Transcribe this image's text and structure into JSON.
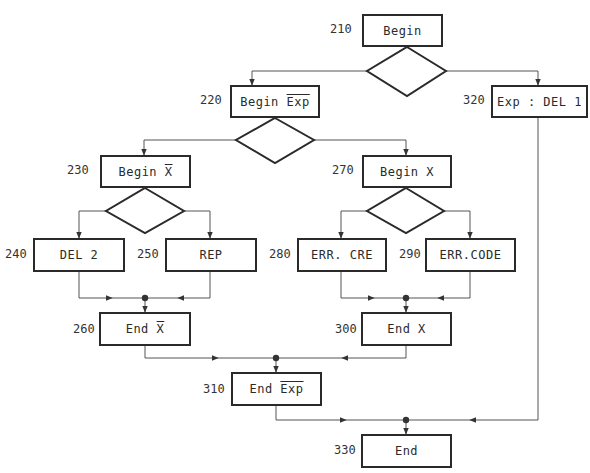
{
  "diagram": {
    "type": "flowchart",
    "nodes": [
      {
        "id": "210",
        "number": "210",
        "text": "Begin",
        "overline": ""
      },
      {
        "id": "220",
        "number": "220",
        "text": "Begin ",
        "overline": "Exp"
      },
      {
        "id": "320",
        "number": "320",
        "text": "Exp : DEL 1",
        "overline": ""
      },
      {
        "id": "230",
        "number": "230",
        "text": "Begin ",
        "overline": "X"
      },
      {
        "id": "270",
        "number": "270",
        "text": "Begin X",
        "overline": ""
      },
      {
        "id": "240",
        "number": "240",
        "text": "DEL 2",
        "overline": ""
      },
      {
        "id": "250",
        "number": "250",
        "text": "REP",
        "overline": ""
      },
      {
        "id": "280",
        "number": "280",
        "text": "ERR. CRE",
        "overline": ""
      },
      {
        "id": "290",
        "number": "290",
        "text": "ERR.CODE",
        "overline": ""
      },
      {
        "id": "260",
        "number": "260",
        "text": "End ",
        "overline": "X"
      },
      {
        "id": "300",
        "number": "300",
        "text": "End X",
        "overline": ""
      },
      {
        "id": "310",
        "number": "310",
        "text": "End ",
        "overline": "Exp"
      },
      {
        "id": "330",
        "number": "330",
        "text": "End",
        "overline": ""
      }
    ],
    "decisions": [
      "after-210",
      "after-220",
      "after-230",
      "after-270"
    ],
    "edges": [
      [
        "210",
        "decision-1"
      ],
      [
        "decision-1",
        "220"
      ],
      [
        "decision-1",
        "320"
      ],
      [
        "220",
        "decision-2"
      ],
      [
        "decision-2",
        "230"
      ],
      [
        "decision-2",
        "270"
      ],
      [
        "230",
        "decision-3"
      ],
      [
        "decision-3",
        "240"
      ],
      [
        "decision-3",
        "250"
      ],
      [
        "270",
        "decision-4"
      ],
      [
        "decision-4",
        "280"
      ],
      [
        "decision-4",
        "290"
      ],
      [
        "240",
        "260"
      ],
      [
        "250",
        "260"
      ],
      [
        "280",
        "300"
      ],
      [
        "290",
        "300"
      ],
      [
        "260",
        "310"
      ],
      [
        "300",
        "310"
      ],
      [
        "310",
        "330"
      ],
      [
        "320",
        "330"
      ]
    ]
  }
}
